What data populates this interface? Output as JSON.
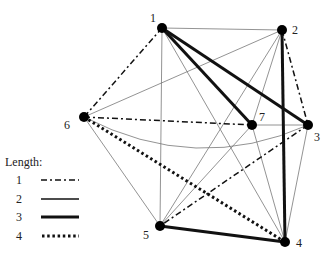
{
  "diagram": {
    "type": "weighted-graph",
    "nodes": [
      {
        "id": "1",
        "label": "1",
        "x": 162,
        "y": 28,
        "lx": 150,
        "ly": 22
      },
      {
        "id": "2",
        "label": "2",
        "x": 282,
        "y": 30,
        "lx": 292,
        "ly": 34
      },
      {
        "id": "3",
        "label": "3",
        "x": 308,
        "y": 125,
        "lx": 314,
        "ly": 141
      },
      {
        "id": "4",
        "label": "4",
        "x": 285,
        "y": 242,
        "lx": 296,
        "ly": 247
      },
      {
        "id": "5",
        "label": "5",
        "x": 160,
        "y": 226,
        "lx": 143,
        "ly": 239
      },
      {
        "id": "6",
        "label": "6",
        "x": 84,
        "y": 117,
        "lx": 64,
        "ly": 129
      },
      {
        "id": "7",
        "label": "7",
        "x": 252,
        "y": 125,
        "lx": 259,
        "ly": 121
      }
    ],
    "edges": [
      {
        "from": "1",
        "to": "2",
        "length": 2
      },
      {
        "from": "1",
        "to": "3",
        "length": 3
      },
      {
        "from": "1",
        "to": "7",
        "length": 3
      },
      {
        "from": "1",
        "to": "5",
        "length": 2
      },
      {
        "from": "1",
        "to": "4",
        "length": 2
      },
      {
        "from": "1",
        "to": "6",
        "length": 1
      },
      {
        "from": "2",
        "to": "3",
        "length": 1
      },
      {
        "from": "2",
        "to": "4",
        "length": 3
      },
      {
        "from": "2",
        "to": "6",
        "length": 2
      },
      {
        "from": "2",
        "to": "5",
        "length": 2
      },
      {
        "from": "2",
        "to": "7",
        "length": 2
      },
      {
        "from": "6",
        "to": "7",
        "length": 1
      },
      {
        "from": "6",
        "to": "3",
        "length": 2,
        "curved": true
      },
      {
        "from": "6",
        "to": "4",
        "length": 4
      },
      {
        "from": "6",
        "to": "5",
        "length": 2
      },
      {
        "from": "7",
        "to": "3",
        "length": 2
      },
      {
        "from": "7",
        "to": "5",
        "length": 2
      },
      {
        "from": "7",
        "to": "4",
        "length": 2
      },
      {
        "from": "3",
        "to": "5",
        "length": 1
      },
      {
        "from": "3",
        "to": "4",
        "length": 2
      },
      {
        "from": "5",
        "to": "4",
        "length": 3
      }
    ]
  },
  "legend": {
    "title": "Length:",
    "items": [
      {
        "value": "1",
        "style": "dash-dot"
      },
      {
        "value": "2",
        "style": "solid-thin"
      },
      {
        "value": "3",
        "style": "solid-thick"
      },
      {
        "value": "4",
        "style": "dotted"
      }
    ]
  }
}
